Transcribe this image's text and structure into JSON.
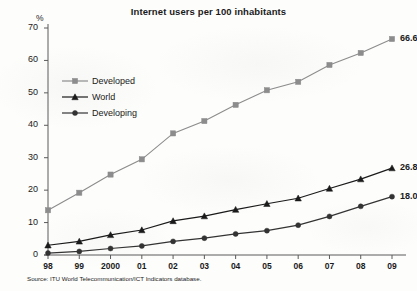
{
  "chart_data": {
    "type": "line",
    "title": "Internet users per 100 inhabitants",
    "xlabel": "",
    "ylabel": "%",
    "ylim": [
      0,
      70
    ],
    "ytick_step": 10,
    "yticks": [
      "0",
      "10",
      "20",
      "30",
      "40",
      "50",
      "60",
      "70"
    ],
    "grid": false,
    "legend_position": "upper-left-inside",
    "categories": [
      "98",
      "99",
      "2000",
      "01",
      "02",
      "03",
      "04",
      "05",
      "06",
      "07",
      "08",
      "09"
    ],
    "series": [
      {
        "name": "Developed",
        "marker": "square",
        "color": "#8c8c8c",
        "values": [
          13.8,
          19.2,
          24.8,
          29.5,
          37.5,
          41.3,
          46.3,
          50.8,
          53.4,
          58.6,
          62.3,
          66.6
        ],
        "end_label": "66.6"
      },
      {
        "name": "World",
        "marker": "triangle",
        "color": "#1a1a1a",
        "values": [
          3.0,
          4.2,
          6.2,
          7.7,
          10.5,
          12.0,
          14.0,
          15.8,
          17.5,
          20.5,
          23.4,
          26.8
        ],
        "end_label": "26.8"
      },
      {
        "name": "Developing",
        "marker": "circle",
        "color": "#333333",
        "values": [
          0.6,
          1.1,
          2.0,
          2.8,
          4.2,
          5.2,
          6.5,
          7.5,
          9.2,
          11.9,
          15.0,
          18.0
        ],
        "end_label": "18.0"
      }
    ],
    "source": "Source: ITU World Telecommunication/ICT Indicators database."
  },
  "legend": {
    "items": [
      {
        "label": "Developed"
      },
      {
        "label": "World"
      },
      {
        "label": "Developing"
      }
    ]
  }
}
